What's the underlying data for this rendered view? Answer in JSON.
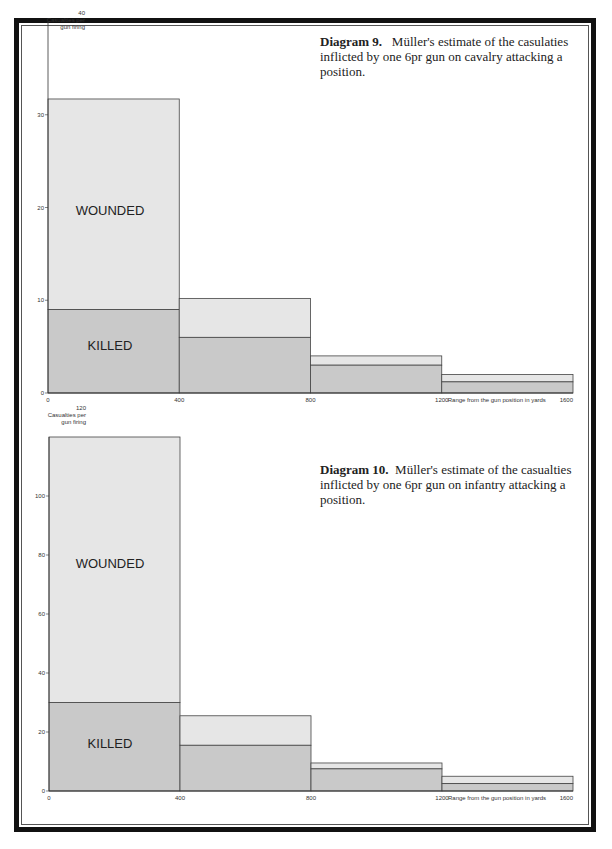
{
  "chart_data": [
    {
      "type": "bar",
      "subtype": "stacked-step-histogram",
      "title": "Diagram 9. Müller's estimate of the casulaties inflicted by one 6pr gun on cavalry attacking a position.",
      "caption_label": "Diagram 9.",
      "caption_text": "Müller's estimate of the casulaties inflicted by one 6pr gun on cavalry attacking a position.",
      "xlabel": "Range from the gun position in yards",
      "ylabel": "Casualties per gun firing",
      "ylim": [
        0,
        40
      ],
      "yticks": [
        0,
        10,
        20,
        30,
        40
      ],
      "xticks": [
        0,
        400,
        800,
        1200,
        1600
      ],
      "categories": [
        "0-400",
        "400-800",
        "800-1200",
        "1200-1600"
      ],
      "series": [
        {
          "name": "KILLED",
          "values": [
            9,
            6,
            3,
            1.2
          ]
        },
        {
          "name": "WOUNDED",
          "values": [
            22.7,
            4.2,
            1,
            0.8
          ]
        }
      ],
      "totals": [
        31.7,
        10.2,
        4,
        2
      ],
      "grid": false
    },
    {
      "type": "bar",
      "subtype": "stacked-step-histogram",
      "title": "Diagram 10. Müller's estimate of the casualties inflicted by one 6pr gun on infantry attacking a position.",
      "caption_label": "Diagram 10.",
      "caption_text": "Müller's estimate of the casualties inflicted by one 6pr gun on infantry attacking a position.",
      "xlabel": "Range from the gun position in yards",
      "ylabel": "Casualties per gun firing",
      "ylim": [
        0,
        120
      ],
      "yticks": [
        0,
        20,
        40,
        60,
        80,
        100,
        120
      ],
      "xticks": [
        0,
        400,
        800,
        1200,
        1600
      ],
      "categories": [
        "0-400",
        "400-800",
        "800-1200",
        "1200-1600"
      ],
      "series": [
        {
          "name": "KILLED",
          "values": [
            30,
            15.5,
            7.5,
            2.5
          ]
        },
        {
          "name": "WOUNDED",
          "values": [
            90,
            10,
            2,
            2.5
          ]
        }
      ],
      "totals": [
        120,
        25.5,
        9.5,
        5
      ],
      "grid": false
    }
  ],
  "labels": {
    "wounded": "WOUNDED",
    "killed": "KILLED",
    "ylabel_line1": "Casualties per",
    "ylabel_line2": "gun firing",
    "xlabel": "Range from the gun position in yards"
  },
  "colors": {
    "killed_fill": "#c9c9c9",
    "wounded_fill": "#e6e6e6",
    "outline": "#444444",
    "frame": "#111111"
  }
}
